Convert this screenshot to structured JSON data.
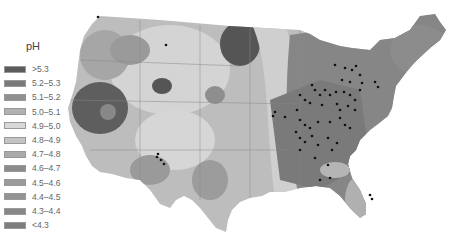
{
  "legend": {
    "title": "pH",
    "items": [
      {
        "label": ">5.3",
        "color": "#5c5c5c"
      },
      {
        "label": "5.2–5.3",
        "color": "#7a7a7a"
      },
      {
        "label": "5.1–5.2",
        "color": "#8f8f8f"
      },
      {
        "label": "5.0–5.1",
        "color": "#b2b2b2"
      },
      {
        "label": "4.9–5.0",
        "color": "#d8d8d8"
      },
      {
        "label": "4.8–4.9",
        "color": "#c4c4c4"
      },
      {
        "label": "4.7–4.8",
        "color": "#aaaaaa"
      },
      {
        "label": "4.6–4.7",
        "color": "#8a8a8a"
      },
      {
        "label": "4.5–4.6",
        "color": "#9a9a9a"
      },
      {
        "label": "4.4–4.5",
        "color": "#939393"
      },
      {
        "label": "4.3–4.4",
        "color": "#878787"
      },
      {
        "label": "<4.3",
        "color": "#7e7e7e"
      }
    ]
  },
  "map": {
    "subject": "Precipitation pH across the contiguous United States",
    "sample_sites": "black dots concentrated in the Ohio Valley / Midwest / Southeast"
  }
}
